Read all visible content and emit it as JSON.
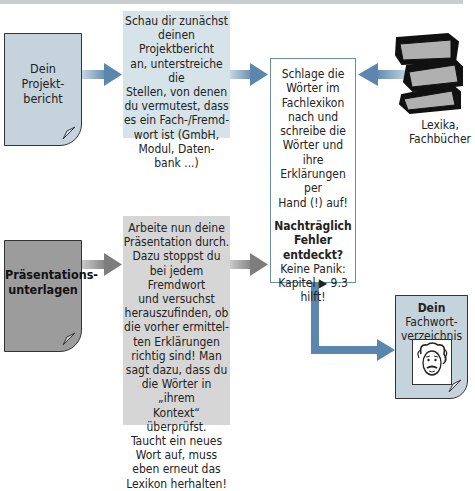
{
  "diagram": {
    "type": "flowchart",
    "colors": {
      "arrow_blue": "#5b86ad",
      "arrow_gray": "#8a8a8a",
      "doc_blue": "#c4d3dc",
      "box_blue": "#d6e3e8",
      "box_gray": "#d6d6d6",
      "doc_gray": "#9c9c9c"
    },
    "nodes": {
      "projektbericht": {
        "lines": [
          "Dein",
          "Projekt-",
          "bericht"
        ]
      },
      "step1": {
        "lines": [
          "Schau dir zunächst",
          "deinen Projektbericht",
          "an, unterstreiche die",
          "Stellen, von denen",
          "du vermutest, dass",
          "es ein Fach-/Fremd-",
          "wort ist (GmbH,",
          "Modul, Daten-",
          "bank ...)"
        ]
      },
      "step2": {
        "lines": [
          "Schlage die",
          "Wörter im",
          "Fachlexikon",
          "nach und",
          "schreibe die",
          "Wörter und ihre",
          "Erklärungen per",
          "Hand (!) auf!"
        ],
        "bold_lines": [
          "Nachträglich",
          "Fehler",
          "entdeckt?"
        ],
        "tail_lines": [
          "Keine Panik:",
          "Kapitel ▶ 9.3",
          "hilft!"
        ]
      },
      "books": {
        "icon": "books-stack-icon",
        "lines": [
          "Lexika,",
          "Fachbücher"
        ]
      },
      "praesentation": {
        "lines": [
          "Präsentations-",
          "unterlagen"
        ]
      },
      "step3": {
        "lines": [
          "Arbeite nun deine",
          "Präsentation durch.",
          "Dazu stoppst du",
          "bei jedem Fremdwort",
          "und versuchst",
          "herauszufinden, ob",
          "die vorher ermittel-",
          "ten Erklärungen",
          "richtig sind! Man",
          "sagt dazu, dass du",
          "die Wörter in „ihrem",
          "Kontext“ überprüfst.",
          "Taucht ein neues",
          "Wort auf, muss",
          "eben erneut das",
          "Lexikon herhalten!"
        ]
      },
      "fachwort": {
        "title": "Dein",
        "lines": [
          "Fachwort-",
          "verzeichnis"
        ],
        "icon": "einstein-portrait-icon"
      }
    },
    "edges": [
      {
        "from": "projektbericht",
        "to": "step1",
        "color": "blue"
      },
      {
        "from": "step1",
        "to": "step2",
        "color": "blue"
      },
      {
        "from": "books",
        "to": "step2",
        "color": "blue"
      },
      {
        "from": "praesentation",
        "to": "step3",
        "color": "gray"
      },
      {
        "from": "step3",
        "to": "step2",
        "color": "gray"
      },
      {
        "from": "step2",
        "to": "fachwort",
        "color": "blue"
      }
    ]
  }
}
